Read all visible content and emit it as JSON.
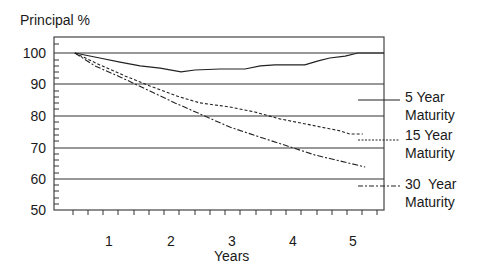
{
  "chart_data": {
    "type": "line",
    "title": "",
    "ylabel": "Principal %",
    "xlabel": "Years",
    "ylim": [
      50,
      104
    ],
    "xlim": [
      -0.1,
      5.55
    ],
    "yticks": [
      "100",
      "90",
      "80",
      "70",
      "60",
      "50"
    ],
    "xticks": [
      "1",
      "2",
      "3",
      "4",
      "5"
    ],
    "grid": "horizontal at 60, 70, 80, 90, 100",
    "legend_position": "right",
    "series": [
      {
        "name": "5 Year Maturity",
        "style": "solid",
        "x": [
          0.44,
          0.85,
          1.18,
          1.51,
          1.84,
          2.18,
          2.41,
          2.82,
          3.23,
          3.48,
          3.72,
          4.21,
          4.43,
          4.62,
          4.87,
          5.08,
          5.51
        ],
        "values": [
          100,
          98.4,
          97.1,
          95.9,
          95.2,
          94.0,
          94.6,
          94.9,
          94.9,
          95.9,
          96.2,
          96.2,
          97.5,
          98.4,
          99.0,
          100,
          100
        ]
      },
      {
        "name": "15 Year Maturity",
        "style": "dotted",
        "x": [
          0.44,
          0.85,
          1.26,
          1.67,
          2.16,
          2.49,
          2.98,
          3.39,
          3.8,
          4.3,
          4.79,
          4.95,
          5.16
        ],
        "values": [
          100,
          96.2,
          92.7,
          89.5,
          86.0,
          84.1,
          82.8,
          81.2,
          79.0,
          77.1,
          75.2,
          74.2,
          74.2
        ]
      },
      {
        "name": "30 Year Maturity",
        "style": "dash-dot",
        "x": [
          0.44,
          0.77,
          1.18,
          1.67,
          2.08,
          2.49,
          2.98,
          3.48,
          3.97,
          4.38,
          4.79,
          5.2
        ],
        "values": [
          100,
          95.9,
          92.4,
          87.9,
          84.1,
          80.6,
          76.4,
          73.2,
          70.1,
          67.5,
          65.6,
          63.7
        ]
      }
    ]
  },
  "labels": {
    "y_title": "Principal %",
    "x_title": "Years",
    "yticks": [
      {
        "label": "100",
        "top": 46
      },
      {
        "label": "90",
        "top": 77
      },
      {
        "label": "80",
        "top": 109
      },
      {
        "label": "70",
        "top": 141
      },
      {
        "label": "60",
        "top": 172
      },
      {
        "label": "50",
        "top": 203
      }
    ],
    "xticks": [
      {
        "label": "1",
        "left": 99
      },
      {
        "label": "2",
        "left": 161
      },
      {
        "label": "3",
        "left": 222
      },
      {
        "label": "4",
        "left": 283
      },
      {
        "label": "5",
        "left": 343
      }
    ],
    "legend": [
      {
        "line1": "5 Year",
        "line2": "Maturity"
      },
      {
        "line1": "15 Year",
        "line2": "Maturity"
      },
      {
        "line1": "30  Year",
        "line2": "Maturity"
      }
    ]
  }
}
